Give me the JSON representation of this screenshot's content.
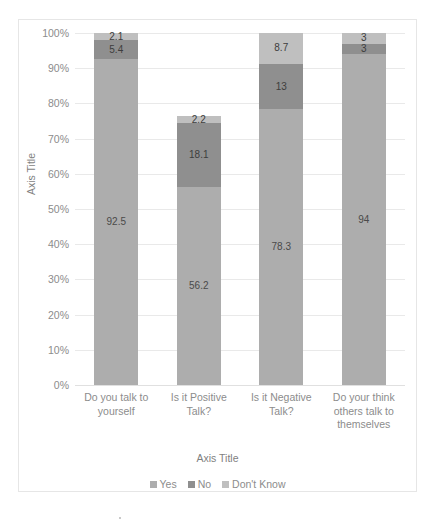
{
  "chart_data": {
    "type": "bar",
    "subtype": "100% stacked column",
    "title": "",
    "xlabel": "Axis Title",
    "ylabel": "Axis Title",
    "categories": [
      "Do you talk to yourself",
      "Is it Positive Talk?",
      "Is it Negative Talk?",
      "Do your think others talk to themselves"
    ],
    "series": [
      {
        "name": "Yes",
        "values": [
          92.5,
          56.2,
          78.3,
          94
        ],
        "color": "#adadad"
      },
      {
        "name": "No",
        "values": [
          5.4,
          18.1,
          13,
          3
        ],
        "color": "#8f8f8f"
      },
      {
        "name": "Don't Know",
        "values": [
          2.1,
          2.2,
          8.7,
          3
        ],
        "color": "#bfbfbf"
      }
    ],
    "stack_order_bottom_to_top": [
      "Yes",
      "No",
      "Don't Know"
    ],
    "ylim": [
      0,
      100
    ],
    "ytick_labels": [
      "0%",
      "10%",
      "20%",
      "30%",
      "40%",
      "50%",
      "60%",
      "70%",
      "80%",
      "90%",
      "100%"
    ],
    "ytick_values": [
      0,
      10,
      20,
      30,
      40,
      50,
      60,
      70,
      80,
      90,
      100
    ],
    "grid": true,
    "grid_axis": "y",
    "legend": true,
    "legend_position": "bottom",
    "legend_entries": [
      "Yes",
      "No",
      "Don't Know"
    ],
    "data_labels": [
      {
        "category": "Do you talk to yourself",
        "labels": [
          "92.5",
          "5.4",
          "2.1"
        ]
      },
      {
        "category": "Is it Positive Talk?",
        "labels": [
          "56.2",
          "18.1",
          "2.2"
        ]
      },
      {
        "category": "Is it Negative Talk?",
        "labels": [
          "78.3",
          "13",
          "8.7"
        ]
      },
      {
        "category": "Do your think others talk to themselves",
        "labels": [
          "94",
          "3",
          "3"
        ]
      }
    ]
  },
  "style": {
    "plot_background": "#ffffff",
    "frame_border": "#e6e6e6",
    "gridline_color": "#e9e9e9",
    "tick_text_color": "#8c8c8c",
    "axis_title_color": "#7f7f7f",
    "data_label_color": "#4a4a4a"
  }
}
